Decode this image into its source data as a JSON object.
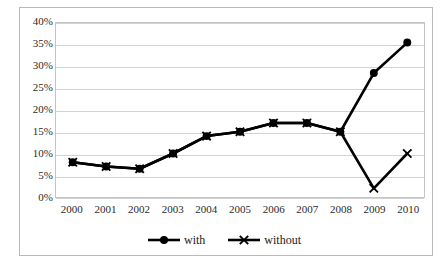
{
  "chart_data": {
    "type": "line",
    "title": "",
    "xlabel": "",
    "ylabel": "",
    "categories": [
      "2000",
      "2001",
      "2002",
      "2003",
      "2004",
      "2005",
      "2006",
      "2007",
      "2008",
      "2009",
      "2010"
    ],
    "series": [
      {
        "name": "with",
        "marker": "circle",
        "values": [
          8,
          7,
          6.5,
          10,
          14,
          15,
          17,
          17,
          15,
          28.5,
          35.5
        ]
      },
      {
        "name": "without",
        "marker": "x",
        "values": [
          8,
          7,
          6.5,
          10,
          14,
          15,
          17,
          17,
          15,
          2,
          10
        ]
      }
    ],
    "ylim": [
      0,
      40
    ],
    "ytick_values": [
      40,
      35,
      30,
      25,
      20,
      15,
      10,
      5,
      0
    ],
    "ytick_labels": [
      "40%",
      "35%",
      "30%",
      "25%",
      "20%",
      "15%",
      "10%",
      "5%",
      "0%"
    ],
    "grid": true,
    "legend_position": "bottom",
    "line_color": "#000000",
    "grid_color": "#d2d2d2",
    "plot_border_color": "#c4c4c4",
    "frame_color": "#b9b9b9",
    "background": "#ffffff"
  },
  "legend": {
    "entries": [
      {
        "label": "with",
        "marker": "circle-marker-icon"
      },
      {
        "label": "without",
        "marker": "x-marker-icon"
      }
    ]
  },
  "title_remnant": ""
}
